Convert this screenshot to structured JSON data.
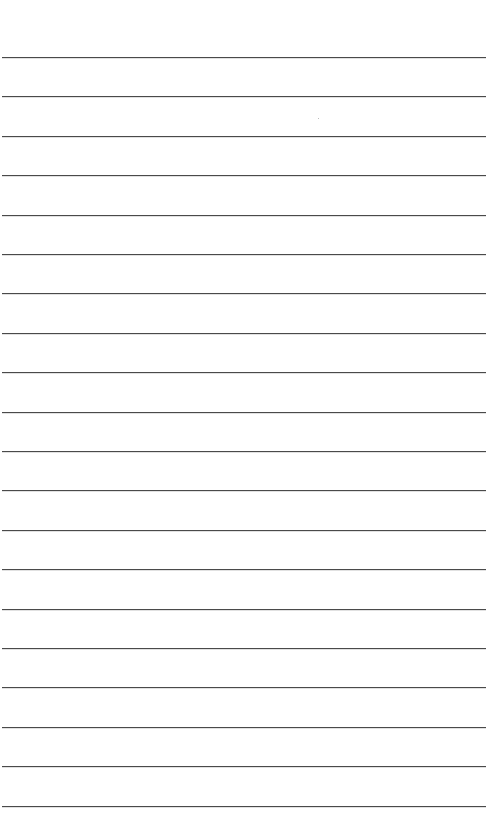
{
  "page": {
    "type": "lined-paper",
    "background": "#ffffff",
    "rule_color": "#4a4a4a",
    "rule_count": 20,
    "first_rule_y": 57,
    "rule_spacing": 39.4,
    "rule_left": 2,
    "rule_width": 484
  }
}
